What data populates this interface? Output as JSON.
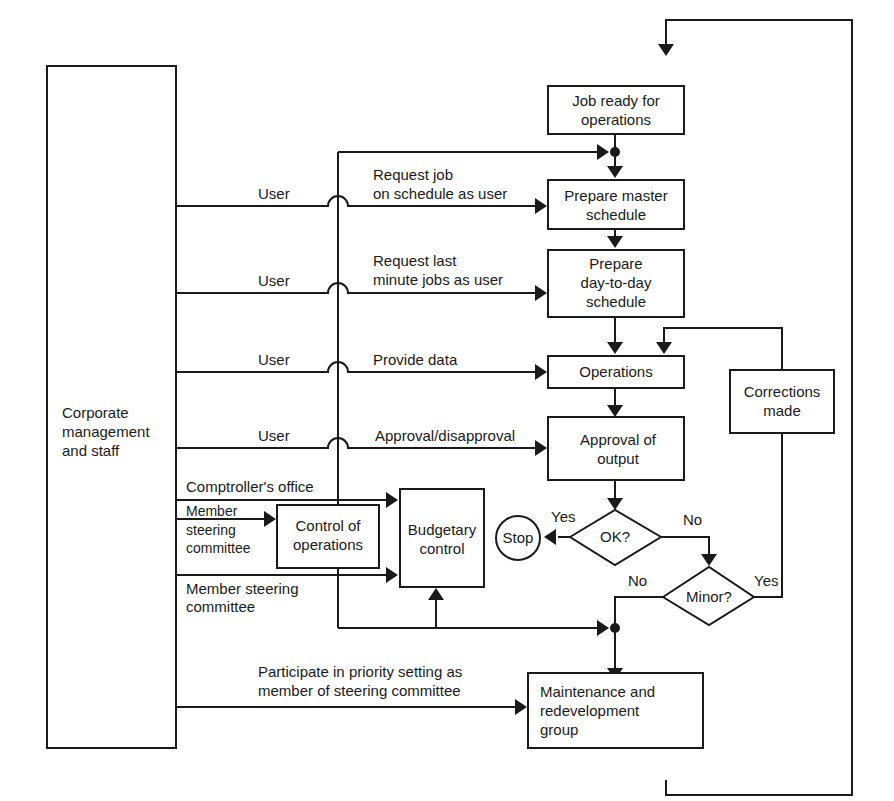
{
  "diagram": {
    "type": "flowchart",
    "nodes": {
      "corporate": {
        "lines": [
          "Corporate",
          "management",
          "and staff"
        ]
      },
      "job_ready": {
        "lines": [
          "Job ready for",
          "operations"
        ]
      },
      "master_schedule": {
        "lines": [
          "Prepare master",
          "schedule"
        ]
      },
      "day_schedule": {
        "lines": [
          "Prepare",
          "day-to-day",
          "schedule"
        ]
      },
      "operations": {
        "lines": [
          "Operations"
        ]
      },
      "approval": {
        "lines": [
          "Approval of",
          "output"
        ]
      },
      "corrections": {
        "lines": [
          "Corrections",
          "made"
        ]
      },
      "ok_decision": {
        "lines": [
          "OK?"
        ]
      },
      "minor_decision": {
        "lines": [
          "Minor?"
        ]
      },
      "stop": {
        "lines": [
          "Stop"
        ]
      },
      "control_ops": {
        "lines": [
          "Control of",
          "operations"
        ]
      },
      "budgetary": {
        "lines": [
          "Budgetary",
          "control"
        ]
      },
      "maintenance": {
        "lines": [
          "Maintenance and",
          "redevelopment",
          "group"
        ]
      }
    },
    "edge_labels": {
      "user_1": "User",
      "user_2": "User",
      "user_3": "User",
      "user_4": "User",
      "request_job": [
        "Request job",
        "on schedule as user"
      ],
      "request_last": [
        "Request last",
        "minute jobs as user"
      ],
      "provide_data": "Provide data",
      "approval_disapproval": "Approval/disapproval",
      "comptroller": "Comptroller's office",
      "member_steering_1": [
        "Member",
        "steering",
        "committee"
      ],
      "member_steering_2": [
        "Member steering",
        "committee"
      ],
      "participate": [
        "Participate in priority setting as",
        "member of steering committee"
      ],
      "ok_yes": "Yes",
      "ok_no": "No",
      "minor_no": "No",
      "minor_yes": "Yes"
    }
  }
}
